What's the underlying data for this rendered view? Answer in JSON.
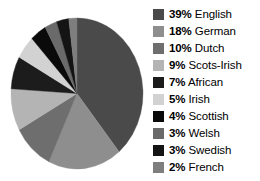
{
  "chart_data": {
    "type": "pie",
    "title": "",
    "categories": [
      "English",
      "German",
      "Dutch",
      "Scots-Irish",
      "African",
      "Irish",
      "Scottish",
      "Welsh",
      "Swedish",
      "French"
    ],
    "values": [
      39,
      18,
      10,
      9,
      7,
      5,
      4,
      3,
      3,
      2
    ],
    "value_unit": "%",
    "legend_position": "right",
    "grid": false,
    "start_angle_deg": 0,
    "direction": "clockwise",
    "slice_colors": [
      "#4a4a4a",
      "#8e8e8e",
      "#6e6e6e",
      "#b4b4b4",
      "#1c1c1c",
      "#d2d2d2",
      "#0a0a0a",
      "#6a6a6a",
      "#141414",
      "#7e7e7e"
    ],
    "background_color": "#ffffff"
  },
  "legend": {
    "items": [
      {
        "pct": "39%",
        "label": "English",
        "color": "#4a4a4a",
        "swatch_name": "legend-swatch-english"
      },
      {
        "pct": "18%",
        "label": "German",
        "color": "#8e8e8e",
        "swatch_name": "legend-swatch-german"
      },
      {
        "pct": "10%",
        "label": "Dutch",
        "color": "#6e6e6e",
        "swatch_name": "legend-swatch-dutch"
      },
      {
        "pct": "9%",
        "label": "Scots-Irish",
        "color": "#b4b4b4",
        "swatch_name": "legend-swatch-scots-irish"
      },
      {
        "pct": "7%",
        "label": "African",
        "color": "#1c1c1c",
        "swatch_name": "legend-swatch-african"
      },
      {
        "pct": "5%",
        "label": "Irish",
        "color": "#d2d2d2",
        "swatch_name": "legend-swatch-irish"
      },
      {
        "pct": "4%",
        "label": "Scottish",
        "color": "#0a0a0a",
        "swatch_name": "legend-swatch-scottish"
      },
      {
        "pct": "3%",
        "label": "Welsh",
        "color": "#6a6a6a",
        "swatch_name": "legend-swatch-welsh"
      },
      {
        "pct": "3%",
        "label": "Swedish",
        "color": "#141414",
        "swatch_name": "legend-swatch-swedish"
      },
      {
        "pct": "2%",
        "label": "French",
        "color": "#7e7e7e",
        "swatch_name": "legend-swatch-french"
      }
    ]
  }
}
